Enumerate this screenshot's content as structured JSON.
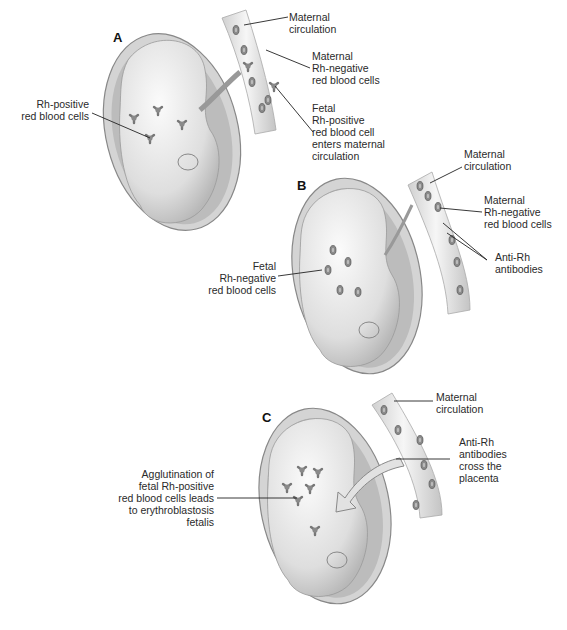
{
  "figure": {
    "panels": [
      {
        "letter": "A",
        "labels": {
          "maternal_circulation": "Maternal\ncirculation",
          "maternal_rh_negative": "Maternal\nRh-negative\nred blood cells",
          "fetal_rh_positive_enters": "Fetal\nRh-positive\nred blood cell\nenters maternal\ncirculation",
          "rh_positive_cells": "Rh-positive\nred blood cells"
        }
      },
      {
        "letter": "B",
        "labels": {
          "maternal_circulation": "Maternal\ncirculation",
          "maternal_rh_negative": "Maternal\nRh-negative\nred blood cells",
          "anti_rh_antibodies": "Anti-Rh\nantibodies",
          "fetal_rh_negative": "Fetal\nRh-negative\nred blood cells"
        }
      },
      {
        "letter": "C",
        "labels": {
          "maternal_circulation": "Maternal\ncirculation",
          "anti_rh_cross": "Anti-Rh\nantibodies\ncross the\nplacenta",
          "agglutination": "Agglutination of\nfetal Rh-positive\nred blood cells leads\nto erythroblastosis\nfetalis"
        }
      }
    ],
    "colors": {
      "background": "#ffffff",
      "line": "#222222",
      "shading": "#9a9a9a",
      "fill": "#ececec"
    }
  }
}
